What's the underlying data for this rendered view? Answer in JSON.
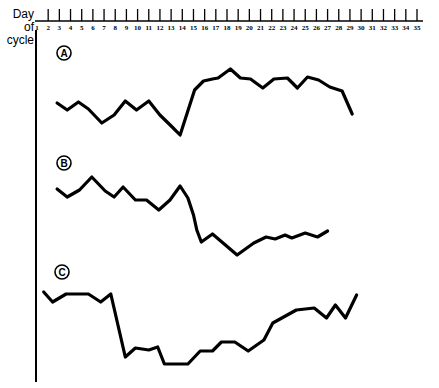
{
  "chart_data": {
    "type": "line",
    "title": "",
    "xlabel": "Day of cycle",
    "ylabel": "",
    "xlim": [
      1,
      35
    ],
    "x_ticks": [
      1,
      2,
      3,
      4,
      5,
      6,
      7,
      8,
      9,
      10,
      11,
      12,
      13,
      14,
      15,
      16,
      17,
      18,
      19,
      20,
      21,
      22,
      23,
      24,
      25,
      26,
      27,
      28,
      29,
      30,
      31,
      32,
      33,
      34,
      35
    ],
    "x_axis_position": "top",
    "grid": false,
    "y_axis": "unlabeled, relative units",
    "series": [
      {
        "name": "A",
        "x": [
          2.8,
          3.7,
          4.7,
          5.6,
          6.8,
          7.9,
          8.9,
          9.9,
          11.0,
          12.0,
          13.1,
          13.8,
          15.1,
          15.9,
          16.7,
          17.2,
          18.3,
          19.2,
          20.1,
          21.2,
          22.2,
          23.4,
          24.3,
          25.2,
          26.2,
          27.2,
          28.3,
          29.2
        ],
        "values": [
          32,
          25,
          33,
          26,
          12,
          20,
          34,
          25,
          34,
          20,
          8,
          0,
          45,
          54,
          56,
          57,
          66,
          57,
          56,
          47,
          56,
          57,
          47,
          58,
          55,
          48,
          44,
          21
        ]
      },
      {
        "name": "B",
        "x": [
          2.8,
          3.7,
          4.8,
          5.9,
          7.1,
          7.9,
          8.7,
          9.8,
          10.8,
          11.9,
          12.9,
          13.8,
          14.5,
          15.0,
          15.3,
          15.7,
          16.7,
          18.9,
          20.4,
          21.5,
          22.3,
          23.2,
          23.8,
          25.0,
          26.1,
          27.0
        ],
        "values": [
          66,
          58,
          65,
          78,
          64,
          58,
          68,
          55,
          55,
          45,
          55,
          69,
          57,
          40,
          25,
          13,
          21,
          0,
          12,
          18,
          16,
          20,
          17,
          22,
          18,
          24
        ]
      },
      {
        "name": "C",
        "x": [
          1.6,
          2.4,
          3.6,
          5.6,
          6.7,
          7.6,
          8.9,
          9.8,
          11.0,
          11.8,
          12.4,
          14.5,
          15.6,
          16.7,
          17.5,
          18.7,
          19.9,
          21.3,
          22.1,
          24.2,
          25.8,
          26.9,
          27.7,
          28.6,
          29.6
        ],
        "values": [
          72,
          62,
          70,
          70,
          62,
          70,
          7,
          16,
          14,
          17,
          0,
          0,
          13,
          13,
          22,
          22,
          13,
          24,
          41,
          54,
          56,
          46,
          59,
          46,
          69
        ]
      }
    ],
    "annotations": [
      "A",
      "B",
      "C"
    ]
  },
  "labels": {
    "axis_title_line1": "Day of",
    "axis_title_line2": "cycle"
  }
}
